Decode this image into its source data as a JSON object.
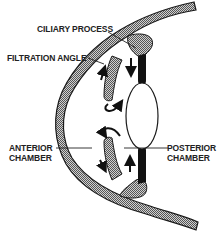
{
  "diagram": {
    "labels": {
      "ciliary_process": "CILIARY PROCESS",
      "filtration_angle": "FILTRATION ANGLE",
      "anterior_chamber_line1": "ANTERIOR",
      "anterior_chamber_line2": "CHAMBER",
      "posterior_chamber_line1": "POSTERIOR",
      "posterior_chamber_line2": "CHAMBER"
    },
    "colors": {
      "tissue_hatch": "#9a9a9a",
      "outline": "#1a1a1a",
      "zonule": "#111111",
      "background": "#ffffff"
    },
    "structures": [
      "cornea-sclera",
      "iris-upper",
      "iris-lower",
      "lens",
      "zonule-upper",
      "zonule-lower"
    ],
    "arrows": [
      "flow-arrow-upper-left",
      "flow-arrow-upper-right",
      "flow-curl-upper",
      "flow-curl-lower",
      "flow-arrow-lower-left",
      "flow-arrow-lower-right"
    ]
  }
}
